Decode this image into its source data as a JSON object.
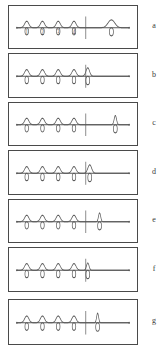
{
  "figure": {
    "title": "",
    "panel_count": 7,
    "colors": {
      "trace": "#5a5a5a",
      "border": "#4a4a4a",
      "background": "#ffffff",
      "text": "#3a3a3a"
    }
  },
  "chart_data": {
    "type": "line",
    "title": "",
    "subtitle": "",
    "xlabel": "",
    "ylabel": "",
    "grid": false,
    "legend": "none",
    "xlim": [
      0,
      130
    ],
    "ylim": [
      -12,
      14
    ],
    "shared": {
      "baseline_y": 0,
      "reference_peaks": [
        {
          "label": "1",
          "x": 18,
          "height": 9.5,
          "width": 4.6
        },
        {
          "label": "2",
          "x": 34,
          "height": 9.5,
          "width": 4.6
        },
        {
          "label": "3",
          "x": 50,
          "height": 9.5,
          "width": 4.6
        },
        {
          "label": "4",
          "x": 66,
          "height": 9.5,
          "width": 4.6
        }
      ],
      "tick_labels_shown_in_panel": "a",
      "tick_labels": [
        "1",
        "2",
        "3",
        "4"
      ]
    },
    "series": [
      {
        "name": "a",
        "label": "a",
        "marker_x": 78,
        "analyte_peak": {
          "x": 104,
          "height": 11.5,
          "width": 7.5,
          "mirror_height": 9.5,
          "mirror_width": 5.2
        },
        "baseline_start_x": 8,
        "baseline_end_x": 122
      },
      {
        "name": "b",
        "label": "b",
        "marker_x": 78,
        "analyte_peak": {
          "x": 80,
          "height": 12.0,
          "width": 4.0,
          "mirror_height": 9.5,
          "mirror_width": 5.0
        },
        "baseline_start_x": 8,
        "baseline_end_x": 122
      },
      {
        "name": "c",
        "label": "c",
        "marker_x": 78,
        "analyte_peak": {
          "x": 108,
          "height": 13.5,
          "width": 2.6,
          "mirror_height": 9.5,
          "mirror_width": 5.0
        },
        "baseline_start_x": 8,
        "baseline_end_x": 122
      },
      {
        "name": "d",
        "label": "d",
        "marker_x": 78,
        "analyte_peak": {
          "x": 82,
          "height": 12.0,
          "width": 4.2,
          "mirror_height": 9.5,
          "mirror_width": 5.0
        },
        "baseline_start_x": 8,
        "baseline_end_x": 122
      },
      {
        "name": "e",
        "label": "e",
        "marker_x": 78,
        "analyte_peak": {
          "x": 92,
          "height": 13.0,
          "width": 2.4,
          "mirror_height": 9.5,
          "mirror_width": 5.0
        },
        "baseline_start_x": 8,
        "baseline_end_x": 122
      },
      {
        "name": "f",
        "label": "f",
        "marker_x": 78,
        "analyte_peak": {
          "x": 80,
          "height": 10.5,
          "width": 2.8,
          "mirror_height": 9.5,
          "mirror_width": 4.8
        },
        "baseline_start_x": 8,
        "baseline_end_x": 122
      },
      {
        "name": "g",
        "label": "g",
        "marker_x": 78,
        "analyte_peak": {
          "x": 90,
          "height": 13.5,
          "width": 2.2,
          "mirror_height": 9.5,
          "mirror_width": 5.0
        },
        "baseline_start_x": 8,
        "baseline_end_x": 122
      }
    ]
  },
  "panels": {
    "a": {
      "label": "a"
    },
    "b": {
      "label": "b"
    },
    "c": {
      "label": "c"
    },
    "d": {
      "label": "d"
    },
    "e": {
      "label": "e"
    },
    "f": {
      "label": "f"
    },
    "g": {
      "label": "g"
    }
  }
}
